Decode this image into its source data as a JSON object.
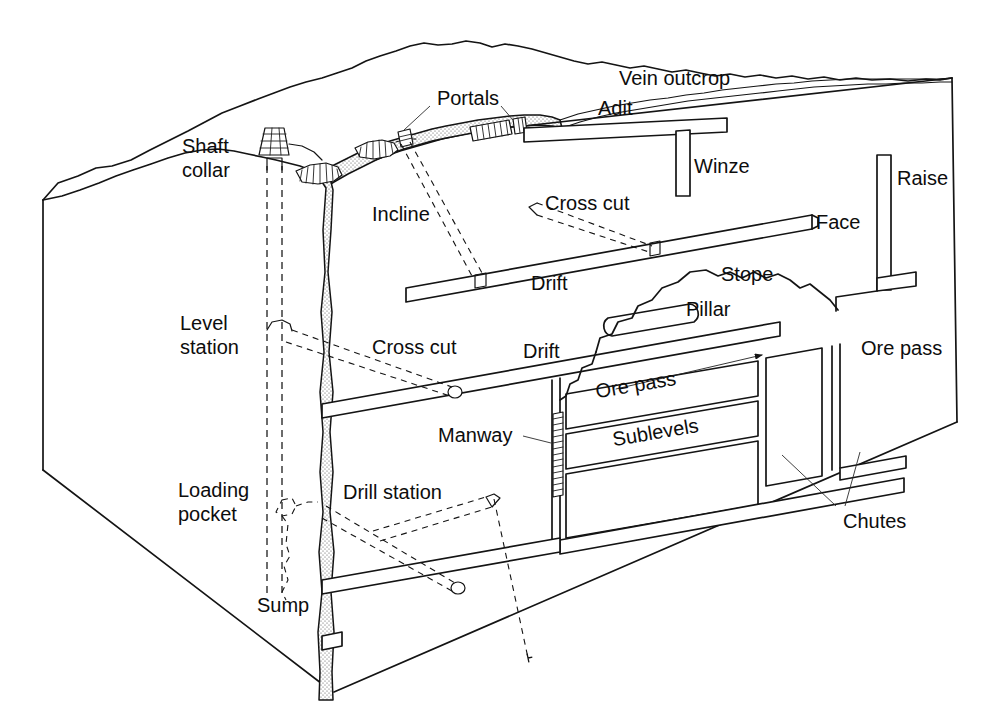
{
  "figure": {
    "type": "isometric cutaway block diagram",
    "background_color": "#ffffff",
    "line_color": "#141414",
    "label_color": "#0d0d0d"
  },
  "labels": {
    "vein_outcrop": "Vein outcrop",
    "portals": "Portals",
    "adit": "Adit",
    "winze": "Winze",
    "raise": "Raise",
    "shaft_collar_line1": "Shaft",
    "shaft_collar_line2": "collar",
    "incline": "Incline",
    "cross_cut_upper": "Cross cut",
    "face": "Face",
    "drift_upper": "Drift",
    "stope": "Stope",
    "pillar": "Pillar",
    "level_station_line1": "Level",
    "level_station_line2": "station",
    "cross_cut_lower": "Cross cut",
    "drift_middle": "Drift",
    "ore_pass_right": "Ore pass",
    "ore_pass_inner": "Ore pass",
    "manway": "Manway",
    "sublevels": "Sublevels",
    "chutes": "Chutes",
    "loading_pocket_line1": "Loading",
    "loading_pocket_line2": "pocket",
    "drill_station": "Drill station",
    "sump": "Sump"
  },
  "features": [
    {
      "name": "vein-outcrop",
      "label": "Vein outcrop",
      "kind": "surface-expression"
    },
    {
      "name": "portals",
      "label": "Portals",
      "kind": "surface-opening"
    },
    {
      "name": "adit",
      "label": "Adit",
      "kind": "horizontal-entry"
    },
    {
      "name": "winze",
      "label": "Winze",
      "kind": "vertical-downward-opening"
    },
    {
      "name": "raise",
      "label": "Raise",
      "kind": "vertical-upward-opening"
    },
    {
      "name": "shaft-collar",
      "label": "Shaft collar",
      "kind": "surface-structure"
    },
    {
      "name": "incline",
      "label": "Incline",
      "kind": "inclined-opening"
    },
    {
      "name": "cross-cut",
      "label": "Cross cut",
      "kind": "horizontal-opening"
    },
    {
      "name": "face",
      "label": "Face",
      "kind": "working-end"
    },
    {
      "name": "drift",
      "label": "Drift",
      "kind": "horizontal-opening"
    },
    {
      "name": "stope",
      "label": "Stope",
      "kind": "excavated-void"
    },
    {
      "name": "pillar",
      "label": "Pillar",
      "kind": "support-rock"
    },
    {
      "name": "level-station",
      "label": "Level station",
      "kind": "shaft-station"
    },
    {
      "name": "ore-pass",
      "label": "Ore pass",
      "kind": "vertical-transfer"
    },
    {
      "name": "manway",
      "label": "Manway",
      "kind": "ladderway"
    },
    {
      "name": "sublevels",
      "label": "Sublevels",
      "kind": "horizontal-opening"
    },
    {
      "name": "chutes",
      "label": "Chutes",
      "kind": "loading-point"
    },
    {
      "name": "loading-pocket",
      "label": "Loading pocket",
      "kind": "shaft-bottom-facility"
    },
    {
      "name": "drill-station",
      "label": "Drill station",
      "kind": "working-place"
    },
    {
      "name": "sump",
      "label": "Sump",
      "kind": "shaft-bottom-facility"
    }
  ]
}
